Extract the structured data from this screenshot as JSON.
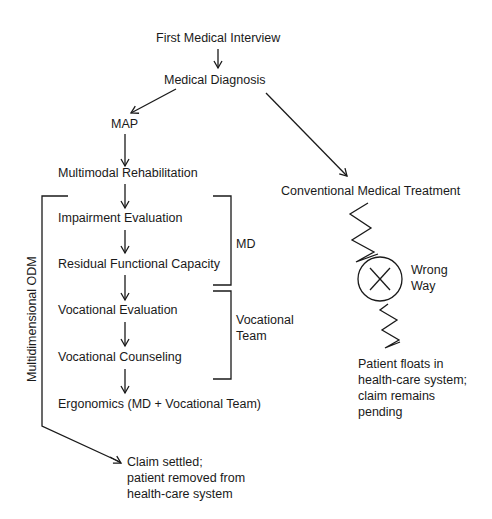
{
  "nodes": {
    "first_interview": "First Medical Interview",
    "diagnosis": "Medical Diagnosis",
    "map": "MAP",
    "multimodal": "Multimodal Rehabilitation",
    "impairment": "Impairment Evaluation",
    "rfc": "Residual Functional Capacity",
    "voc_eval": "Vocational Evaluation",
    "voc_counsel": "Vocational Counseling",
    "ergonomics": "Ergonomics (MD + Vocational Team)",
    "conventional": "Conventional Medical Treatment"
  },
  "brackets": {
    "md": "MD",
    "voc_team_line1": "Vocational",
    "voc_team_line2": "Team",
    "odm": "Multidimensional ODM"
  },
  "outcomes": {
    "settled": [
      "Claim settled;",
      "patient removed from",
      "health-care system"
    ],
    "wrong_way": [
      "Wrong",
      "Way"
    ],
    "floats": [
      "Patient floats in",
      "health-care system;",
      "claim remains",
      "pending"
    ]
  }
}
